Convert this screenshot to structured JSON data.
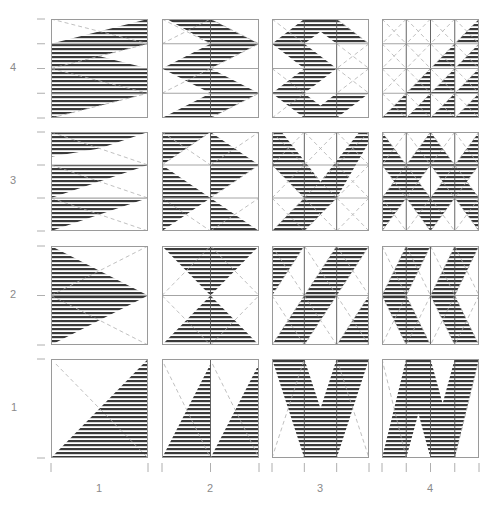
{
  "figure": {
    "type": "pattern-grid",
    "stripe_color": "#3a3a3a",
    "frame_color": "#9a9a9a",
    "dash_color": "#b0b0b0",
    "label_color": "#8a8a8a",
    "stripe_period_px": 4,
    "stripe_dark_px": 2
  },
  "axes": {
    "x_labels": [
      "1",
      "2",
      "3",
      "4"
    ],
    "y_labels": [
      "4",
      "3",
      "2",
      "1"
    ]
  },
  "layout": {
    "col_x": [
      51,
      162,
      272,
      382
    ],
    "row_y": [
      19,
      132,
      246,
      359
    ],
    "panel_w": 97,
    "panel_h": 99,
    "x_label_y": 488,
    "y_label_x": 13
  },
  "panels": [
    {
      "row": "4",
      "col": "1",
      "vdiv": 1,
      "hdiv": 4,
      "shapes": [
        [
          [
            0,
            0.25
          ],
          [
            1,
            0
          ],
          [
            1,
            0.25
          ],
          [
            0.5,
            0.375
          ],
          [
            1,
            0.5
          ],
          [
            0,
            0.75
          ],
          [
            0,
            0.5
          ],
          [
            0.5,
            0.375
          ],
          [
            0,
            0.25
          ]
        ],
        [
          [
            0,
            0.75
          ],
          [
            1,
            0.5
          ],
          [
            1,
            0.75
          ],
          [
            0.5,
            0.875
          ],
          [
            0,
            1
          ]
        ],
        [
          [
            0,
            0.25
          ],
          [
            0.5,
            0.375
          ],
          [
            0,
            0.5
          ]
        ]
      ],
      "dashes": [
        [
          [
            0,
            0
          ],
          [
            1,
            0.25
          ]
        ],
        [
          [
            0,
            0.5
          ],
          [
            1,
            0.25
          ]
        ],
        [
          [
            0,
            0.5
          ],
          [
            1,
            0.75
          ]
        ],
        [
          [
            0,
            1
          ],
          [
            1,
            0.75
          ]
        ]
      ]
    },
    {
      "row": "4",
      "col": "2",
      "vdiv": 2,
      "hdiv": 4,
      "shapes": [
        [
          [
            0.05,
            0
          ],
          [
            0.5,
            0
          ],
          [
            1,
            0.25
          ],
          [
            0.5,
            0.5
          ],
          [
            0,
            0.5
          ],
          [
            0.5,
            0.25
          ]
        ],
        [
          [
            0,
            0.5
          ],
          [
            0.5,
            0.5
          ],
          [
            1,
            0.75
          ],
          [
            0.5,
            1
          ],
          [
            0,
            1
          ],
          [
            0.5,
            0.75
          ]
        ]
      ],
      "dashes": [
        [
          [
            0,
            0.25
          ],
          [
            0.5,
            0
          ]
        ],
        [
          [
            0.5,
            0.5
          ],
          [
            1,
            0.25
          ]
        ],
        [
          [
            0,
            0.75
          ],
          [
            0.5,
            0.5
          ]
        ],
        [
          [
            0.5,
            1
          ],
          [
            1,
            0.75
          ]
        ],
        [
          [
            0,
            0
          ],
          [
            0.5,
            0.25
          ]
        ],
        [
          [
            0.5,
            0
          ],
          [
            1,
            0.25
          ]
        ]
      ]
    },
    {
      "row": "4",
      "col": "3",
      "vdiv": 3,
      "hdiv": 4,
      "shapes": [
        [
          [
            0.333,
            0
          ],
          [
            0.667,
            0
          ],
          [
            1,
            0.25
          ],
          [
            0.667,
            0.25
          ],
          [
            0.5,
            0.125
          ],
          [
            0.333,
            0.25
          ],
          [
            0.667,
            0.5
          ],
          [
            0.333,
            0.75
          ],
          [
            0.5,
            0.875
          ],
          [
            0.667,
            0.75
          ],
          [
            1,
            0.75
          ],
          [
            0.667,
            1
          ],
          [
            0.333,
            1
          ],
          [
            0,
            0.75
          ],
          [
            0.333,
            0.5
          ],
          [
            0,
            0.25
          ]
        ]
      ],
      "dashes": [
        [
          [
            0,
            0
          ],
          [
            0.333,
            0.25
          ]
        ],
        [
          [
            0.667,
            0
          ],
          [
            1,
            0.25
          ]
        ],
        [
          [
            0.667,
            0.25
          ],
          [
            1,
            0.5
          ]
        ],
        [
          [
            1,
            0.25
          ],
          [
            0.667,
            0.5
          ]
        ],
        [
          [
            0.667,
            0.5
          ],
          [
            1,
            0.75
          ]
        ],
        [
          [
            1,
            0.5
          ],
          [
            0.667,
            0.75
          ]
        ],
        [
          [
            0,
            0.5
          ],
          [
            0.333,
            0.75
          ]
        ],
        [
          [
            0,
            1
          ],
          [
            0.333,
            0.75
          ]
        ]
      ]
    },
    {
      "row": "4",
      "col": "4",
      "vdiv": 4,
      "hdiv": 4,
      "shapes": [
        [
          [
            1,
            0
          ],
          [
            1,
            0.25
          ],
          [
            0.75,
            0.25
          ]
        ],
        [
          [
            0.75,
            0.25
          ],
          [
            0.75,
            0.5
          ],
          [
            0.5,
            0.5
          ]
        ],
        [
          [
            1,
            0.25
          ],
          [
            1,
            0.5
          ],
          [
            0.75,
            0.5
          ]
        ],
        [
          [
            0.5,
            0.5
          ],
          [
            0.5,
            0.75
          ],
          [
            0.25,
            0.75
          ]
        ],
        [
          [
            0.75,
            0.5
          ],
          [
            0.75,
            0.75
          ],
          [
            0.5,
            0.75
          ]
        ],
        [
          [
            1,
            0.5
          ],
          [
            1,
            0.75
          ],
          [
            0.75,
            0.75
          ]
        ],
        [
          [
            0.25,
            0.75
          ],
          [
            0.25,
            1
          ],
          [
            0,
            1
          ]
        ],
        [
          [
            0.5,
            0.75
          ],
          [
            0.5,
            1
          ],
          [
            0.25,
            1
          ]
        ],
        [
          [
            0.75,
            0.75
          ],
          [
            0.75,
            1
          ],
          [
            0.5,
            1
          ]
        ],
        [
          [
            1,
            0.75
          ],
          [
            1,
            1
          ],
          [
            0.75,
            1
          ]
        ]
      ],
      "dashes": "cells-x"
    },
    {
      "row": "3",
      "col": "1",
      "vdiv": 1,
      "hdiv": 3,
      "shapes": [
        [
          [
            0,
            0
          ],
          [
            1,
            0
          ],
          [
            0,
            0.333
          ]
        ],
        [
          [
            0,
            0.333
          ],
          [
            1,
            0.333
          ],
          [
            0,
            0.667
          ]
        ],
        [
          [
            0,
            0.667
          ],
          [
            1,
            0.667
          ],
          [
            0,
            1
          ]
        ],
        [
          [
            0,
            0.333
          ],
          [
            0.5,
            0.167
          ],
          [
            0,
            0.25
          ]
        ]
      ],
      "dashes": [
        [
          [
            0,
            0
          ],
          [
            1,
            0.333
          ]
        ],
        [
          [
            0,
            0.333
          ],
          [
            1,
            0.667
          ]
        ],
        [
          [
            0,
            0.667
          ],
          [
            1,
            1
          ]
        ]
      ]
    },
    {
      "row": "3",
      "col": "2",
      "vdiv": 2,
      "hdiv": 3,
      "shapes": [
        [
          [
            0,
            0
          ],
          [
            0.5,
            0
          ],
          [
            0,
            0.333
          ]
        ],
        [
          [
            0,
            0.333
          ],
          [
            0.5,
            0.667
          ],
          [
            0,
            1
          ]
        ],
        [
          [
            0.5,
            0
          ],
          [
            1,
            0.333
          ],
          [
            0.5,
            0.667
          ]
        ],
        [
          [
            0.5,
            0.667
          ],
          [
            1,
            1
          ],
          [
            0.5,
            1
          ]
        ]
      ],
      "dashes": [
        [
          [
            0,
            0
          ],
          [
            0.5,
            0.333
          ]
        ],
        [
          [
            0,
            0.333
          ],
          [
            0.5,
            0
          ]
        ],
        [
          [
            0.5,
            0.333
          ],
          [
            1,
            0
          ]
        ],
        [
          [
            0.5,
            0.667
          ],
          [
            1,
            0.333
          ]
        ],
        [
          [
            0,
            0.667
          ],
          [
            0.5,
            1
          ]
        ],
        [
          [
            0.5,
            1
          ],
          [
            1,
            0.667
          ]
        ]
      ]
    },
    {
      "row": "3",
      "col": "3",
      "vdiv": 3,
      "hdiv": 3,
      "shapes": [
        [
          [
            0,
            0
          ],
          [
            0.1,
            0
          ],
          [
            0.5,
            0.5
          ],
          [
            0.9,
            0
          ],
          [
            1,
            0
          ],
          [
            1,
            0.1
          ],
          [
            0.667,
            0.667
          ],
          [
            0.333,
            1
          ],
          [
            0,
            1
          ],
          [
            0.333,
            0.667
          ],
          [
            0,
            0.333
          ]
        ]
      ],
      "dashes": "cells-x"
    },
    {
      "row": "3",
      "col": "4",
      "vdiv": 4,
      "hdiv": 3,
      "shapes": [
        [
          [
            0,
            0
          ],
          [
            0.25,
            0.333
          ],
          [
            0.5,
            0
          ],
          [
            0.75,
            0.333
          ],
          [
            1,
            0
          ],
          [
            1,
            0.333
          ],
          [
            0.875,
            0.5
          ],
          [
            1,
            0.667
          ],
          [
            1,
            1
          ],
          [
            0.75,
            0.667
          ],
          [
            0.5,
            1
          ],
          [
            0.25,
            0.667
          ],
          [
            0,
            1
          ],
          [
            0,
            0.667
          ],
          [
            0.125,
            0.5
          ],
          [
            0,
            0.333
          ]
        ],
        [
          [
            0.5,
            0.333
          ],
          [
            0.625,
            0.5
          ],
          [
            0.5,
            0.667
          ],
          [
            0.375,
            0.5
          ]
        ]
      ],
      "holes": [
        [
          [
            0.5,
            0.333
          ],
          [
            0.625,
            0.5
          ],
          [
            0.5,
            0.667
          ],
          [
            0.375,
            0.5
          ]
        ]
      ],
      "dashes": "cells-x"
    },
    {
      "row": "2",
      "col": "1",
      "vdiv": 1,
      "hdiv": 2,
      "shapes": [
        [
          [
            0,
            0
          ],
          [
            1,
            0.5
          ],
          [
            0,
            1
          ]
        ]
      ],
      "dashes": [
        [
          [
            0,
            0.5
          ],
          [
            1,
            0
          ]
        ],
        [
          [
            0,
            0.5
          ],
          [
            1,
            1
          ]
        ]
      ]
    },
    {
      "row": "2",
      "col": "2",
      "vdiv": 2,
      "hdiv": 2,
      "shapes": [
        [
          [
            0,
            0
          ],
          [
            1,
            0
          ],
          [
            0.5,
            0.5
          ]
        ],
        [
          [
            0.5,
            0.5
          ],
          [
            1,
            1
          ],
          [
            0,
            1
          ]
        ]
      ],
      "dashes": [
        [
          [
            0,
            0.5
          ],
          [
            0.5,
            0
          ]
        ],
        [
          [
            0.5,
            0
          ],
          [
            1,
            0.5
          ]
        ],
        [
          [
            0,
            0.5
          ],
          [
            0.5,
            1
          ]
        ],
        [
          [
            0.5,
            1
          ],
          [
            1,
            0.5
          ]
        ]
      ]
    },
    {
      "row": "2",
      "col": "3",
      "vdiv": 3,
      "hdiv": 2,
      "shapes": [
        [
          [
            0,
            0
          ],
          [
            0.333,
            0
          ],
          [
            0,
            0.5
          ]
        ],
        [
          [
            0.667,
            0
          ],
          [
            1,
            0
          ],
          [
            0.333,
            1
          ],
          [
            0,
            1
          ]
        ],
        [
          [
            1,
            0.5
          ],
          [
            1,
            1
          ],
          [
            0.667,
            1
          ]
        ]
      ],
      "dashes": "cells-x"
    },
    {
      "row": "2",
      "col": "4",
      "vdiv": 4,
      "hdiv": 2,
      "shapes": [
        [
          [
            0.25,
            0
          ],
          [
            0.5,
            0
          ],
          [
            0.25,
            0.5
          ],
          [
            0.5,
            1
          ],
          [
            0.25,
            1
          ],
          [
            0,
            0.5
          ]
        ],
        [
          [
            0.75,
            0
          ],
          [
            1,
            0
          ],
          [
            0.75,
            0.5
          ],
          [
            1,
            1
          ],
          [
            0.75,
            1
          ],
          [
            0.5,
            0.5
          ]
        ]
      ],
      "dashes": "cells-x"
    },
    {
      "row": "1",
      "col": "1",
      "vdiv": 1,
      "hdiv": 1,
      "shapes": [
        [
          [
            1,
            0
          ],
          [
            1,
            1
          ],
          [
            0,
            1
          ]
        ]
      ],
      "dashes": [
        [
          [
            0.05,
            0.05
          ],
          [
            1,
            1
          ]
        ]
      ]
    },
    {
      "row": "1",
      "col": "2",
      "vdiv": 2,
      "hdiv": 1,
      "shapes": [
        [
          [
            0.5,
            0.05
          ],
          [
            0.5,
            1
          ],
          [
            0,
            1
          ]
        ],
        [
          [
            1,
            0.05
          ],
          [
            1,
            1
          ],
          [
            0.5,
            1
          ]
        ]
      ],
      "dashes": [
        [
          [
            0.02,
            0.05
          ],
          [
            0.5,
            1
          ]
        ],
        [
          [
            0.52,
            0.05
          ],
          [
            1,
            1
          ]
        ]
      ]
    },
    {
      "row": "1",
      "col": "3",
      "vdiv": 3,
      "hdiv": 1,
      "shapes": [
        [
          [
            0,
            0
          ],
          [
            0.333,
            0
          ],
          [
            0.5,
            0.5
          ],
          [
            0.667,
            0
          ],
          [
            1,
            0
          ],
          [
            0.667,
            1
          ],
          [
            0.333,
            1
          ]
        ]
      ],
      "dashes": [
        [
          [
            0,
            1
          ],
          [
            0.333,
            0
          ]
        ],
        [
          [
            0.667,
            0
          ],
          [
            1,
            1
          ]
        ]
      ]
    },
    {
      "row": "1",
      "col": "4",
      "vdiv": 4,
      "hdiv": 1,
      "shapes": [
        [
          [
            0.25,
            0
          ],
          [
            0.5,
            0
          ],
          [
            0.625,
            0.45
          ],
          [
            0.75,
            0
          ],
          [
            1,
            0
          ],
          [
            0.75,
            1
          ],
          [
            0.5,
            1
          ],
          [
            0.375,
            0.55
          ],
          [
            0.25,
            1
          ],
          [
            0,
            1
          ]
        ]
      ],
      "dashes": [
        [
          [
            0,
            0
          ],
          [
            0.25,
            1
          ]
        ],
        [
          [
            1,
            0
          ],
          [
            0.75,
            1
          ]
        ]
      ]
    }
  ]
}
